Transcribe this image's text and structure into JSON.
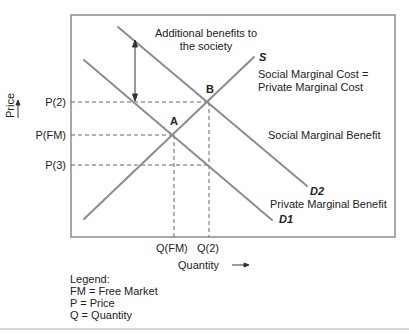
{
  "diagram": {
    "type": "supply-demand-externality",
    "axes": {
      "y_label": "Price",
      "y_arrow": "⟶",
      "x_label": "Quantity",
      "x_arrow": "⟶"
    },
    "price_ticks": [
      {
        "label": "P(2)"
      },
      {
        "label": "P(FM)"
      },
      {
        "label": "P(3)"
      }
    ],
    "quantity_ticks": [
      {
        "label": "Q(FM)"
      },
      {
        "label": "Q(2)"
      }
    ],
    "points": {
      "a": "A",
      "b": "B"
    },
    "curves": {
      "supply": {
        "label": "S",
        "description_line1": "Social Marginal Cost =",
        "description_line2": "Private Marginal Cost"
      },
      "d2": {
        "label": "D2",
        "description": "Social Marginal Benefit"
      },
      "d1": {
        "label": "D1",
        "description": "Private Marginal Benefit"
      }
    },
    "annotation": {
      "line1": "Additional benefits to",
      "line2": "the society"
    },
    "legend": {
      "title": "Legend:",
      "items": [
        "FM = Free Market",
        "P = Price",
        "Q = Quantity"
      ]
    },
    "colors": {
      "curve": "#8c8c8c",
      "frame": "#8c8c8c",
      "dash": "#555555",
      "text": "#222222"
    }
  }
}
